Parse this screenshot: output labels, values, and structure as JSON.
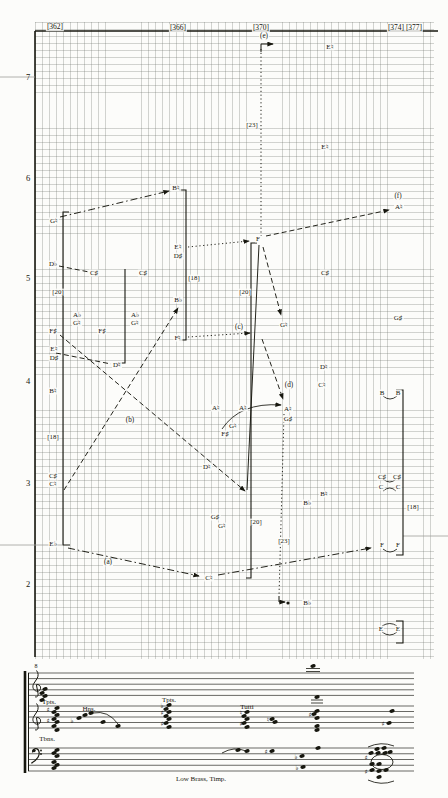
{
  "figure": {
    "measure_labels": [
      {
        "t": "[362]",
        "x": 55,
        "y": 27
      },
      {
        "t": "[366]",
        "x": 178,
        "y": 28
      },
      {
        "t": "[370]",
        "x": 261,
        "y": 28
      },
      {
        "t": "[374]",
        "x": 396,
        "y": 28
      },
      {
        "t": "[377]",
        "x": 414,
        "y": 28
      }
    ],
    "register_labels": [
      {
        "t": "7",
        "x": 28,
        "y": 77
      },
      {
        "t": "6",
        "x": 28,
        "y": 178
      },
      {
        "t": "5",
        "x": 28,
        "y": 278
      },
      {
        "t": "4",
        "x": 28,
        "y": 381
      },
      {
        "t": "3",
        "x": 28,
        "y": 483
      },
      {
        "t": "2",
        "x": 28,
        "y": 584
      }
    ],
    "note_labels": [
      {
        "t": "G♮",
        "x": 54,
        "y": 221
      },
      {
        "t": "D♭",
        "x": 53,
        "y": 264
      },
      {
        "t": "F♯",
        "x": 53,
        "y": 331
      },
      {
        "t": "E♮",
        "x": 54,
        "y": 349
      },
      {
        "t": "D♯",
        "x": 54,
        "y": 358
      },
      {
        "t": "B♮",
        "x": 53,
        "y": 391
      },
      {
        "t": "C♯",
        "x": 53,
        "y": 476
      },
      {
        "t": "C♮",
        "x": 53,
        "y": 484
      },
      {
        "t": "E♭",
        "x": 53,
        "y": 544
      },
      {
        "t": "C♯",
        "x": 94,
        "y": 273
      },
      {
        "t": "A♭",
        "x": 77,
        "y": 315
      },
      {
        "t": "G♮",
        "x": 77,
        "y": 323
      },
      {
        "t": "F♯",
        "x": 102,
        "y": 331
      },
      {
        "t": "D♮",
        "x": 117,
        "y": 365
      },
      {
        "t": "B♮",
        "x": 176,
        "y": 188
      },
      {
        "t": "E♮",
        "x": 178,
        "y": 247
      },
      {
        "t": "D♯",
        "x": 178,
        "y": 256
      },
      {
        "t": "C♯",
        "x": 143,
        "y": 273
      },
      {
        "t": "A♭",
        "x": 135,
        "y": 315
      },
      {
        "t": "G♮",
        "x": 135,
        "y": 323
      },
      {
        "t": "B♭",
        "x": 178,
        "y": 300
      },
      {
        "t": "F♮",
        "x": 178,
        "y": 338
      },
      {
        "t": "F",
        "x": 258,
        "y": 239
      },
      {
        "t": "E♮",
        "x": 330,
        "y": 47
      },
      {
        "t": "E♮",
        "x": 325,
        "y": 147
      },
      {
        "t": "A♮",
        "x": 399,
        "y": 207
      },
      {
        "t": "C♯",
        "x": 325,
        "y": 273
      },
      {
        "t": "G♮",
        "x": 284,
        "y": 325
      },
      {
        "t": "G♯",
        "x": 398,
        "y": 318
      },
      {
        "t": "D♮",
        "x": 324,
        "y": 367
      },
      {
        "t": "C♮",
        "x": 322,
        "y": 385
      },
      {
        "t": "A♮",
        "x": 216,
        "y": 408
      },
      {
        "t": "A♮",
        "x": 243,
        "y": 408
      },
      {
        "t": "G♮",
        "x": 233,
        "y": 426
      },
      {
        "t": "F♯",
        "x": 225,
        "y": 434
      },
      {
        "t": "A♮",
        "x": 288,
        "y": 409
      },
      {
        "t": "G♯",
        "x": 288,
        "y": 419
      },
      {
        "t": "D♮",
        "x": 207,
        "y": 467
      },
      {
        "t": "B♮",
        "x": 324,
        "y": 494
      },
      {
        "t": "B♭",
        "x": 307,
        "y": 503
      },
      {
        "t": "G♯",
        "x": 215,
        "y": 517
      },
      {
        "t": "G♮",
        "x": 222,
        "y": 526
      },
      {
        "t": "C♮",
        "x": 209,
        "y": 578
      },
      {
        "t": "B♭",
        "x": 307,
        "y": 603
      },
      {
        "t": "B",
        "x": 382,
        "y": 393
      },
      {
        "t": "B",
        "x": 398,
        "y": 393
      },
      {
        "t": "C♯",
        "x": 382,
        "y": 477
      },
      {
        "t": "C♯",
        "x": 397,
        "y": 477
      },
      {
        "t": "C",
        "x": 381,
        "y": 487
      },
      {
        "t": "C",
        "x": 398,
        "y": 487
      },
      {
        "t": "F",
        "x": 382,
        "y": 545
      },
      {
        "t": "F",
        "x": 398,
        "y": 545
      },
      {
        "t": "E",
        "x": 381,
        "y": 629
      },
      {
        "t": "E",
        "x": 398,
        "y": 629
      }
    ],
    "duration_labels": [
      {
        "t": "[20]",
        "x": 58,
        "y": 292
      },
      {
        "t": "[18]",
        "x": 53,
        "y": 437
      },
      {
        "t": "[18]",
        "x": 194,
        "y": 278
      },
      {
        "t": "[20]",
        "x": 245,
        "y": 292
      },
      {
        "t": "[23]",
        "x": 252,
        "y": 125
      },
      {
        "t": "[20]",
        "x": 256,
        "y": 522
      },
      {
        "t": "[23]",
        "x": 284,
        "y": 541
      },
      {
        "t": "[18]",
        "x": 413,
        "y": 507
      }
    ],
    "annotation_labels": [
      {
        "t": "(e)",
        "x": 264,
        "y": 37
      },
      {
        "t": "(f)",
        "x": 398,
        "y": 197
      },
      {
        "t": "(c)",
        "x": 239,
        "y": 328
      },
      {
        "t": "(d)",
        "x": 289,
        "y": 386
      },
      {
        "t": "(b)",
        "x": 130,
        "y": 421
      },
      {
        "t": "(a)",
        "x": 108,
        "y": 563
      }
    ],
    "axis": {
      "top": {
        "x1": 35,
        "y1": 31,
        "x2": 438,
        "y2": 31
      },
      "left": {
        "x1": 35,
        "y1": 31,
        "x2": 35,
        "y2": 657
      }
    },
    "faint_lines": [
      {
        "x1": 0,
        "y1": 77,
        "x2": 35,
        "y2": 77
      },
      {
        "x1": 0,
        "y1": 545,
        "x2": 62,
        "y2": 545
      },
      {
        "x1": 403,
        "y1": 536,
        "x2": 448,
        "y2": 536
      }
    ],
    "lines": [
      {
        "x1": 60,
        "y1": 217,
        "x2": 169,
        "y2": 191,
        "style": "dashdot",
        "arrow": true
      },
      {
        "x1": 59,
        "y1": 266,
        "x2": 89,
        "y2": 272,
        "style": "dash",
        "arrow": false
      },
      {
        "x1": 188,
        "y1": 247,
        "x2": 249,
        "y2": 241,
        "style": "dot",
        "arrow": true
      },
      {
        "x1": 188,
        "y1": 337,
        "x2": 250,
        "y2": 333,
        "style": "dot",
        "arrow": true
      },
      {
        "x1": 266,
        "y1": 236,
        "x2": 389,
        "y2": 210,
        "style": "dash",
        "arrow": true
      },
      {
        "x1": 263,
        "y1": 247,
        "x2": 281,
        "y2": 315,
        "style": "dash",
        "arrow": true
      },
      {
        "x1": 262,
        "y1": 339,
        "x2": 283,
        "y2": 399,
        "style": "dash",
        "arrow": true
      },
      {
        "x1": 259,
        "y1": 245,
        "x2": 247,
        "y2": 490,
        "style": "solid",
        "arrow": false
      },
      {
        "x1": 60,
        "y1": 335,
        "x2": 245,
        "y2": 491,
        "style": "dash",
        "arrow": true
      },
      {
        "x1": 64,
        "y1": 490,
        "x2": 178,
        "y2": 308,
        "style": "dash",
        "arrow": true
      },
      {
        "x1": 68,
        "y1": 548,
        "x2": 199,
        "y2": 576,
        "style": "dashdot",
        "arrow": true
      },
      {
        "x1": 218,
        "y1": 575,
        "x2": 371,
        "y2": 548,
        "style": "dashdot",
        "arrow": true
      },
      {
        "x1": 56,
        "y1": 353,
        "x2": 111,
        "y2": 364,
        "style": "dash",
        "arrow": false
      },
      {
        "x1": 261,
        "y1": 49,
        "x2": 261,
        "y2": 236,
        "style": "dot",
        "arrow": false
      },
      {
        "x1": 284,
        "y1": 414,
        "x2": 279,
        "y2": 596,
        "style": "dot",
        "arrow": false
      }
    ],
    "elbows": [
      {
        "points": "261,52 261,44 273,44",
        "arrow": true
      },
      {
        "points": "279,596 279,602 285,602",
        "arrow": true
      }
    ],
    "dots": [
      {
        "x": 288,
        "y": 603,
        "r": 1.6
      }
    ],
    "brackets": [
      {
        "points": "69,212 63,212 63,545 70,545"
      },
      {
        "points": "125,269 125,363 118,363"
      },
      {
        "points": "179,190 186,190 186,340 179,340"
      },
      {
        "points": "257,243 251,243 251,578 246,578"
      },
      {
        "points": "396,390 403,390 403,555 396,555"
      },
      {
        "points": "396,621 403,621 403,643 396,643"
      }
    ],
    "slurs": [
      {
        "x1": 383,
        "y1": 396,
        "cx": 390,
        "cy": 402,
        "x2": 397,
        "y2": 396,
        "arrow": false
      },
      {
        "x1": 383,
        "y1": 479,
        "cx": 390,
        "cy": 485,
        "x2": 396,
        "y2": 479,
        "arrow": false
      },
      {
        "x1": 383,
        "y1": 491,
        "cx": 390,
        "cy": 485,
        "x2": 396,
        "y2": 491,
        "arrow": false
      },
      {
        "x1": 383,
        "y1": 549,
        "cx": 390,
        "cy": 555,
        "x2": 397,
        "y2": 549,
        "arrow": false
      },
      {
        "x1": 382,
        "y1": 626,
        "cx": 390,
        "cy": 621,
        "x2": 397,
        "y2": 626,
        "arrow": false
      },
      {
        "x1": 382,
        "y1": 632,
        "cx": 390,
        "cy": 638,
        "x2": 397,
        "y2": 632,
        "arrow": false
      },
      {
        "x1": 222,
        "y1": 429,
        "cx": 240,
        "cy": 402,
        "x2": 281,
        "y2": 405,
        "arrow": true
      }
    ]
  },
  "score": {
    "labels": [
      {
        "t": "8",
        "x": 36,
        "y": 666,
        "cls": "octave-label"
      },
      {
        "t": "Tpts.",
        "x": 49,
        "y": 702,
        "cls": "instrument-label"
      },
      {
        "t": "Hns.",
        "x": 89,
        "y": 709,
        "cls": "instrument-label"
      },
      {
        "t": "Tpts.",
        "x": 169,
        "y": 700,
        "cls": "instrument-label"
      },
      {
        "t": "Tutti",
        "x": 247,
        "y": 707,
        "cls": "instrument-label"
      },
      {
        "t": "Tbns.",
        "x": 47,
        "y": 739,
        "cls": "instrument-label"
      },
      {
        "t": "Low Brass, Timp.",
        "x": 201,
        "y": 779,
        "cls": "instrument-label"
      }
    ],
    "staves": [
      {
        "clef": "treble",
        "x1": 28,
        "x2": 414,
        "top": 673,
        "gap": 5.6
      },
      {
        "clef": "treble",
        "x1": 28,
        "x2": 414,
        "top": 706,
        "gap": 5.5
      },
      {
        "clef": "bass",
        "x1": 28,
        "x2": 414,
        "top": 748,
        "gap": 5.75
      }
    ],
    "barline": {
      "x": 28.5,
      "y1": 673,
      "y2": 771
    },
    "brace": {
      "x": 25,
      "y1": 671,
      "y2": 773,
      "w": 2.6
    },
    "notes": [
      {
        "x": 45,
        "y": 689
      },
      {
        "x": 42,
        "y": 693
      },
      {
        "x": 45,
        "y": 696
      },
      {
        "x": 42,
        "y": 700
      },
      {
        "x": 313,
        "y": 666
      },
      {
        "x": 57,
        "y": 708
      },
      {
        "x": 54,
        "y": 712
      },
      {
        "x": 57,
        "y": 715
      },
      {
        "x": 54,
        "y": 719
      },
      {
        "x": 57,
        "y": 722
      },
      {
        "x": 54,
        "y": 726
      },
      {
        "x": 57,
        "y": 730
      },
      {
        "x": 79,
        "y": 718
      },
      {
        "x": 85,
        "y": 715
      },
      {
        "x": 91,
        "y": 713
      },
      {
        "x": 103,
        "y": 722
      },
      {
        "x": 118,
        "y": 726
      },
      {
        "x": 169,
        "y": 705
      },
      {
        "x": 166,
        "y": 709
      },
      {
        "x": 169,
        "y": 712
      },
      {
        "x": 166,
        "y": 716
      },
      {
        "x": 169,
        "y": 719
      },
      {
        "x": 166,
        "y": 723
      },
      {
        "x": 169,
        "y": 727
      },
      {
        "x": 247,
        "y": 712
      },
      {
        "x": 244,
        "y": 716
      },
      {
        "x": 247,
        "y": 719
      },
      {
        "x": 244,
        "y": 723
      },
      {
        "x": 247,
        "y": 727
      },
      {
        "x": 272,
        "y": 719
      },
      {
        "x": 275,
        "y": 722
      },
      {
        "x": 317,
        "y": 697
      },
      {
        "x": 317,
        "y": 711
      },
      {
        "x": 314,
        "y": 714
      },
      {
        "x": 317,
        "y": 718
      },
      {
        "x": 317,
        "y": 726
      },
      {
        "x": 317,
        "y": 730
      },
      {
        "x": 392,
        "y": 711
      },
      {
        "x": 389,
        "y": 723
      },
      {
        "x": 57,
        "y": 750
      },
      {
        "x": 54,
        "y": 753
      },
      {
        "x": 57,
        "y": 756
      },
      {
        "x": 54,
        "y": 762
      },
      {
        "x": 57,
        "y": 765
      },
      {
        "x": 54,
        "y": 768
      },
      {
        "x": 238,
        "y": 750
      },
      {
        "x": 247,
        "y": 751
      },
      {
        "x": 272,
        "y": 751
      },
      {
        "x": 302,
        "y": 756
      },
      {
        "x": 303,
        "y": 767
      },
      {
        "x": 318,
        "y": 748
      },
      {
        "x": 377,
        "y": 749
      },
      {
        "x": 384,
        "y": 748
      },
      {
        "x": 371,
        "y": 753
      },
      {
        "x": 378,
        "y": 753
      },
      {
        "x": 385,
        "y": 753
      },
      {
        "x": 390,
        "y": 752
      },
      {
        "x": 372,
        "y": 764
      },
      {
        "x": 379,
        "y": 764
      },
      {
        "x": 372,
        "y": 770
      },
      {
        "x": 379,
        "y": 771
      },
      {
        "x": 386,
        "y": 770
      },
      {
        "x": 379,
        "y": 777
      }
    ],
    "accidentals": [
      {
        "g": "♯",
        "x": 48,
        "y": 710
      },
      {
        "g": "♯",
        "x": 48,
        "y": 721
      },
      {
        "g": "♭",
        "x": 72,
        "y": 721
      },
      {
        "g": "♭",
        "x": 162,
        "y": 706
      },
      {
        "g": "♯",
        "x": 162,
        "y": 713
      },
      {
        "g": "♯",
        "x": 162,
        "y": 724
      },
      {
        "g": "♮",
        "x": 241,
        "y": 713
      },
      {
        "g": "♯",
        "x": 241,
        "y": 724
      },
      {
        "g": "♮",
        "x": 268,
        "y": 720
      },
      {
        "g": "♯",
        "x": 310,
        "y": 715
      },
      {
        "g": "♯",
        "x": 383,
        "y": 724
      },
      {
        "g": "♯",
        "x": 266,
        "y": 752
      },
      {
        "g": "♭",
        "x": 296,
        "y": 757
      },
      {
        "g": "♭",
        "x": 297,
        "y": 768
      },
      {
        "g": "♯",
        "x": 366,
        "y": 758
      },
      {
        "g": "♯",
        "x": 366,
        "y": 772
      }
    ],
    "ledgers": [
      {
        "x1": 306,
        "y": 668.5,
        "x2": 320
      },
      {
        "x1": 306,
        "y": 671.5,
        "x2": 320
      },
      {
        "x1": 311,
        "y": 700,
        "x2": 323
      },
      {
        "x1": 311,
        "y": 703,
        "x2": 323
      }
    ],
    "slurs": [
      {
        "x1": 93,
        "y1": 713,
        "cx": 108,
        "cy": 710,
        "x2": 118,
        "y2": 724
      },
      {
        "x1": 222,
        "y1": 753,
        "cx": 234,
        "cy": 746,
        "x2": 246,
        "y2": 751
      },
      {
        "x1": 368,
        "y1": 747,
        "cx": 381,
        "cy": 741,
        "x2": 394,
        "y2": 746
      },
      {
        "x1": 368,
        "y1": 780,
        "cx": 381,
        "cy": 786,
        "x2": 394,
        "y2": 781
      }
    ],
    "cluster_ellipse": {
      "cx": 382,
      "cy": 762,
      "rx": 11,
      "ry": 7.5
    }
  }
}
